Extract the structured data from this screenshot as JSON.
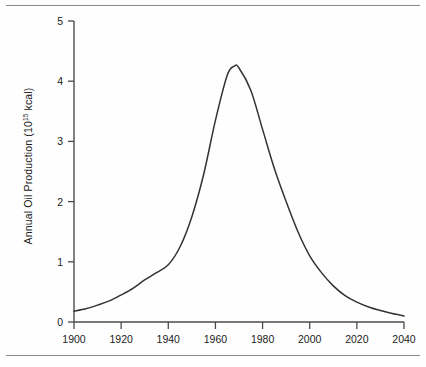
{
  "figure": {
    "ylabel_prefix": "Annual Oil Production (10",
    "ylabel_exponent": "15",
    "ylabel_suffix": " kcal)"
  },
  "chart_data": {
    "type": "line",
    "title": "",
    "xlabel": "",
    "ylabel": "Annual Oil Production (10^15 kcal)",
    "xlim": [
      1900,
      2040
    ],
    "ylim": [
      0,
      5
    ],
    "xticks": [
      1900,
      1920,
      1940,
      1960,
      1980,
      2000,
      2020,
      2040
    ],
    "yticks": [
      0,
      1,
      2,
      3,
      4,
      5
    ],
    "xtick_labels": [
      "1900",
      "1920",
      "1940",
      "1960",
      "1980",
      "2000",
      "2020",
      "2040"
    ],
    "ytick_labels": [
      "0",
      "1",
      "2",
      "3",
      "4",
      "5"
    ],
    "grid": false,
    "legend": false,
    "series": [
      {
        "name": "Annual oil production",
        "color": "#333333",
        "x": [
          1900,
          1905,
          1910,
          1915,
          1920,
          1925,
          1930,
          1935,
          1940,
          1945,
          1950,
          1955,
          1960,
          1965,
          1968,
          1970,
          1975,
          1980,
          1985,
          1990,
          1995,
          2000,
          2005,
          2010,
          2015,
          2020,
          2025,
          2030,
          2035,
          2040
        ],
        "y": [
          0.18,
          0.22,
          0.28,
          0.35,
          0.45,
          0.56,
          0.7,
          0.82,
          0.95,
          1.25,
          1.75,
          2.45,
          3.35,
          4.1,
          4.25,
          4.22,
          3.85,
          3.2,
          2.55,
          2.0,
          1.5,
          1.1,
          0.82,
          0.6,
          0.44,
          0.33,
          0.25,
          0.19,
          0.14,
          0.1
        ]
      }
    ],
    "annotations": {
      "peak_year": 1968,
      "peak_value": 4.25,
      "start_value": 0.18,
      "end_value": 0.1
    }
  }
}
